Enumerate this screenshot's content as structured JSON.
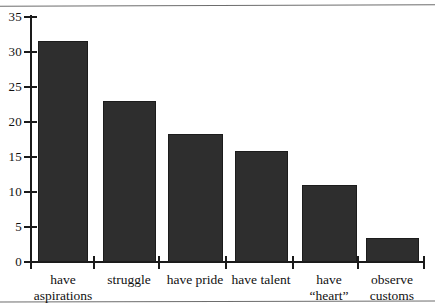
{
  "chart_data": {
    "type": "bar",
    "title": "",
    "subtitle": "",
    "xlabel": "",
    "ylabel": "",
    "categories": [
      "have\naspirations",
      "struggle",
      "have pride",
      "have talent",
      "have\n“heart”",
      "observe\ncustoms"
    ],
    "values": [
      31.6,
      23.0,
      18.3,
      15.9,
      11.0,
      3.4
    ],
    "ylim": [
      0,
      35
    ],
    "yticks": [
      0,
      5,
      10,
      15,
      20,
      25,
      30,
      35
    ],
    "ytick_labels": [
      "0",
      "5",
      "10",
      "15",
      "20",
      "25",
      "30",
      "35"
    ],
    "grid": false,
    "legend": null,
    "bar_color": "#2e2e2e",
    "axis_color": "#1a1a1a",
    "background": "#ffffff"
  },
  "figure": {
    "name": "bar-chart",
    "rules": {
      "top": "",
      "bottom": ""
    }
  }
}
